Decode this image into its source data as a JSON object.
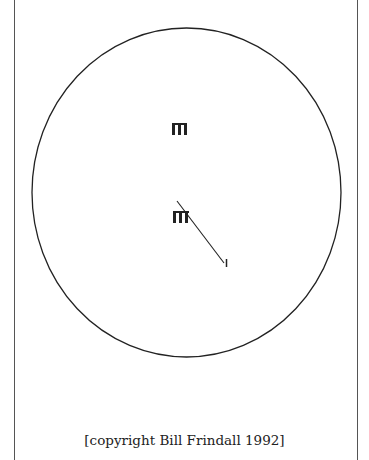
{
  "diagram": {
    "field_boundary": {
      "cx": 186.5,
      "cy": 192.5,
      "rx": 154.5,
      "ry": 164.5
    },
    "wickets": [
      {
        "name": "top-wicket",
        "x": 172,
        "y": 123,
        "w": 15,
        "h": 12
      },
      {
        "name": "bottom-wicket",
        "x": 173,
        "y": 211,
        "w": 16,
        "h": 12
      }
    ],
    "shot_line": {
      "x1": 177,
      "y1": 201,
      "x2": 224,
      "y2": 263
    },
    "fielder_marker": {
      "x": 226,
      "y1": 259,
      "y2": 267
    },
    "colors": {
      "ink": "#222222",
      "page_border": "#555555",
      "background": "#ffffff"
    }
  },
  "caption": "[copyright Bill Frindall 1992]"
}
